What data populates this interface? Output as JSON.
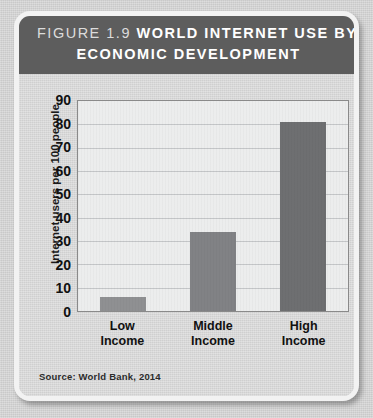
{
  "figure": {
    "number_label": "FIGURE 1.9",
    "title_line_1": "WORLD INTERNET USE BY",
    "title_line_2": "ECONOMIC DEVELOPMENT",
    "source_note": "Source: World Bank, 2014"
  },
  "colors": {
    "title_bar": "#5d5d5d",
    "title_text": "#ffffff",
    "figure_number_text": "#dcdcdc",
    "card_background": "#cfcfcf",
    "card_border": "#f2f2f2",
    "page_background": "#c9c9c9",
    "plot_background": "#eceded",
    "plot_frame": "#8a8a8a",
    "gridline": "#c4c6c8",
    "bar_low": "#8f9092",
    "bar_middle": "#818285",
    "bar_high": "#6e6f71",
    "axis_text": "#111111"
  },
  "chart_data": {
    "type": "bar",
    "xlabel": "",
    "ylabel": "Internet users per 100 people",
    "categories": [
      "Low Income",
      "Middle Income",
      "High Income"
    ],
    "category_lines": [
      [
        "Low",
        "Income"
      ],
      [
        "Middle",
        "Income"
      ],
      [
        "High",
        "Income"
      ]
    ],
    "values": [
      6,
      34,
      81
    ],
    "bar_colors": [
      "#8f9092",
      "#818285",
      "#6e6f71"
    ],
    "ylim": [
      0,
      90
    ],
    "ytick_step": 10,
    "yticks": [
      0,
      10,
      20,
      30,
      40,
      50,
      60,
      70,
      80,
      90
    ],
    "ytick_labels": [
      "0",
      "10",
      "20",
      "30",
      "40",
      "50",
      "60",
      "70",
      "80",
      "90"
    ],
    "grid": true,
    "grid_axis": "y",
    "legend": false,
    "legend_position": "none",
    "source": "Source: World Bank, 2014"
  }
}
